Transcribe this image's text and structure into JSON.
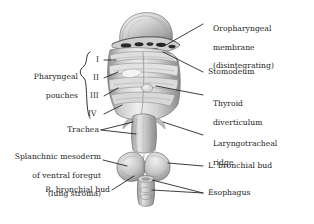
{
  "figure": {
    "background_color": "#ffffff",
    "ink_color": "#1b1b1b",
    "illustration_tone": "grayscale"
  },
  "labels": {
    "oropharyngeal_membrane": {
      "line1": "Oropharyngeal",
      "line2": "membrane",
      "line3": "(disintegrating)"
    },
    "stomodeum": "Stomodeum",
    "thyroid_diverticulum": {
      "line1": "Thyroid",
      "line2": "diverticulum"
    },
    "laryngotracheal_ridge": {
      "line1": "Laryngotracheal",
      "line2": "ridge"
    },
    "l_bronchial_bud": "L. bronchial bud",
    "esophagus": "Esophagus",
    "pharyngeal_pouches": {
      "line1": "Pharyngeal",
      "line2": "pouches"
    },
    "trachea": "Trachea",
    "splanchnic_mesoderm": {
      "line1": "Splanchnic mesoderm",
      "line2": "of ventral foregut",
      "line3": "(lung stroma)"
    },
    "r_bronchial_bud": "R. bronchial bud"
  },
  "pouch_numerals": [
    {
      "numeral": "I"
    },
    {
      "numeral": "II"
    },
    {
      "numeral": "III"
    },
    {
      "numeral": "IV"
    }
  ]
}
